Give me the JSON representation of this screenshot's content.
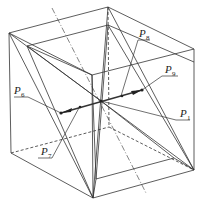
{
  "figure": {
    "type": "cube-geometry-diagram",
    "stroke_color": "#333333",
    "labels": [
      {
        "id": "P1",
        "base": "P",
        "sub": "1"
      },
      {
        "id": "P6",
        "base": "P",
        "sub": "6"
      },
      {
        "id": "P7",
        "base": "P",
        "sub": "7"
      },
      {
        "id": "P8",
        "base": "P",
        "sub": "8"
      },
      {
        "id": "P9",
        "base": "P",
        "sub": "9"
      }
    ]
  }
}
